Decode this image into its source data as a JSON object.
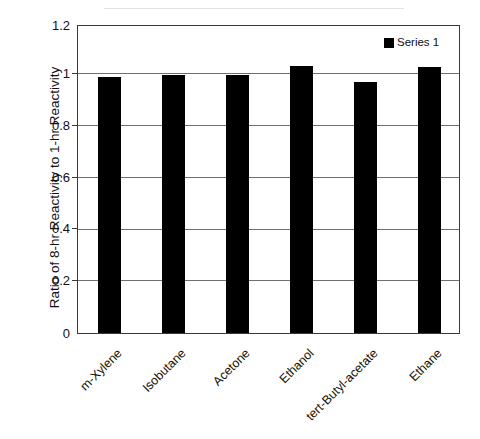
{
  "chart_data": {
    "type": "bar",
    "title": "",
    "subtitle": "",
    "xlabel": "",
    "ylabel": "Ratio of 8-hr Reactivity to 1-hr Reactivity",
    "categories": [
      "m-Xylene",
      "Isobutane",
      "Acetone",
      "Ethanol",
      "tert-Butyl-acetate",
      "Ethane"
    ],
    "series": [
      {
        "name": "Series 1",
        "color": "#000000",
        "values": [
          1.0,
          1.01,
          1.01,
          1.045,
          0.98,
          1.04
        ]
      }
    ],
    "ylim": [
      0,
      1.2
    ],
    "ytick_labels": [
      "1.2",
      "1",
      "0.8",
      "0.6",
      "0.4",
      "0.2",
      "0"
    ],
    "ytick_values": [
      1.2,
      1.0,
      0.8,
      0.6,
      0.4,
      0.2,
      0
    ],
    "grid": true,
    "grid_axis": "y",
    "legend_position": "top-right-inside",
    "legend_entries": [
      "Series 1"
    ],
    "xtick_rotation": -45,
    "plot_background": "#ffffff",
    "frame_color": "#3a3a3a",
    "gridline_color": "#707070"
  }
}
